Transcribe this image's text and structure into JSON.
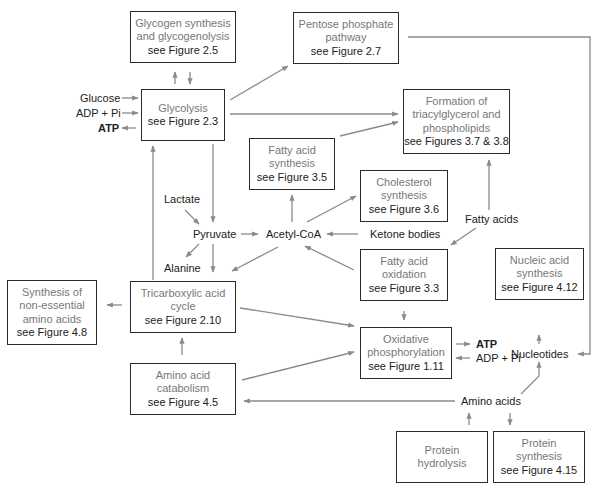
{
  "diagram": {
    "type": "metabolic-pathway-overview",
    "boxes": {
      "glycogen": {
        "lines": [
          "Glycogen synthesis",
          "and glycogenolysis"
        ],
        "ref": "see Figure 2.5"
      },
      "pentose": {
        "lines": [
          "Pentose phosphate",
          "pathway"
        ],
        "ref": "see Figure 2.7"
      },
      "glycolysis": {
        "lines": [
          "Glycolysis"
        ],
        "ref": "see Figure 2.3"
      },
      "triacylglycerol": {
        "lines": [
          "Formation of",
          "triacylglycerol and",
          "phospholipids"
        ],
        "ref": "see Figures 3.7 & 3.8"
      },
      "fatty_acid_synthesis": {
        "lines": [
          "Fatty acid",
          "synthesis"
        ],
        "ref": "see Figure 3.5"
      },
      "cholesterol": {
        "lines": [
          "Cholesterol",
          "synthesis"
        ],
        "ref": "see Figure 3.6"
      },
      "fatty_acid_oxidation": {
        "lines": [
          "Fatty acid",
          "oxidation"
        ],
        "ref": "see Figure 3.3"
      },
      "nonessential_aa": {
        "lines": [
          "Synthesis of",
          "non-essential",
          "amino acids"
        ],
        "ref": "see Figure 4.8"
      },
      "tca": {
        "lines": [
          "Tricarboxylic acid",
          "cycle"
        ],
        "ref": "see Figure 2.10"
      },
      "nucleic_acid": {
        "lines": [
          "Nucleic acid",
          "synthesis"
        ],
        "ref": "see Figure 4.12"
      },
      "oxphos": {
        "lines": [
          "Oxidative",
          "phosphorylation"
        ],
        "ref": "see Figure 1.11"
      },
      "aa_catabolism": {
        "lines": [
          "Amino acid",
          "catabolism"
        ],
        "ref": "see Figure 4.5"
      },
      "protein_hydrolysis": {
        "lines": [
          "Protein",
          "hydrolysis"
        ],
        "ref": ""
      },
      "protein_synthesis": {
        "lines": [
          "Protein",
          "synthesis"
        ],
        "ref": "see Figure 4.15"
      }
    },
    "labels": {
      "glucose": "Glucose",
      "adp_pi_1": "ADP + Pi",
      "atp_1": "ATP",
      "lactate": "Lactate",
      "pyruvate": "Pyruvate",
      "alanine": "Alanine",
      "acetyl_coa": "Acetyl-CoA",
      "ketone_bodies": "Ketone bodies",
      "fatty_acids": "Fatty acids",
      "nucleotides": "Nucleotides",
      "atp_2": "ATP",
      "adp_pi_2": "ADP + Pi",
      "amino_acids": "Amino acids"
    },
    "colors": {
      "box_border": "#2b2b2b",
      "arrow": "#8a8a8a",
      "process_text": "#777777",
      "reference_text": "#222222"
    }
  }
}
